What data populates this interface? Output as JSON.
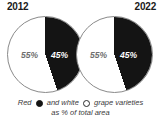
{
  "chart_data": {
    "type": "pie",
    "title": "Red and white grape varieties as % of total area",
    "charts": [
      {
        "label": "2012",
        "categories": [
          "Red",
          "White"
        ],
        "values": [
          45,
          55
        ],
        "value_labels": [
          "45%",
          "55%"
        ],
        "colors": [
          "#141414",
          "#ffffff"
        ]
      },
      {
        "label": "2022",
        "categories": [
          "Red",
          "White"
        ],
        "values": [
          45,
          55
        ],
        "value_labels": [
          "45%",
          "55%"
        ],
        "colors": [
          "#141414",
          "#ffffff"
        ]
      }
    ],
    "legend": {
      "position": "bottom",
      "line1_prefix": "Red",
      "line1_middle": "and white",
      "line1_suffix": "grape varieties",
      "line2": "as % of total area",
      "red_marker": "filled-circle-icon",
      "white_marker": "hollow-circle-icon"
    },
    "unit": "%",
    "grid": false
  },
  "colors": {
    "red_variety": "#141414",
    "white_variety": "#ffffff",
    "outline": "#8a8a8a",
    "label_dark": "#6e6e6e",
    "label_light": "#ffffff",
    "text": "#1a1a1a"
  }
}
